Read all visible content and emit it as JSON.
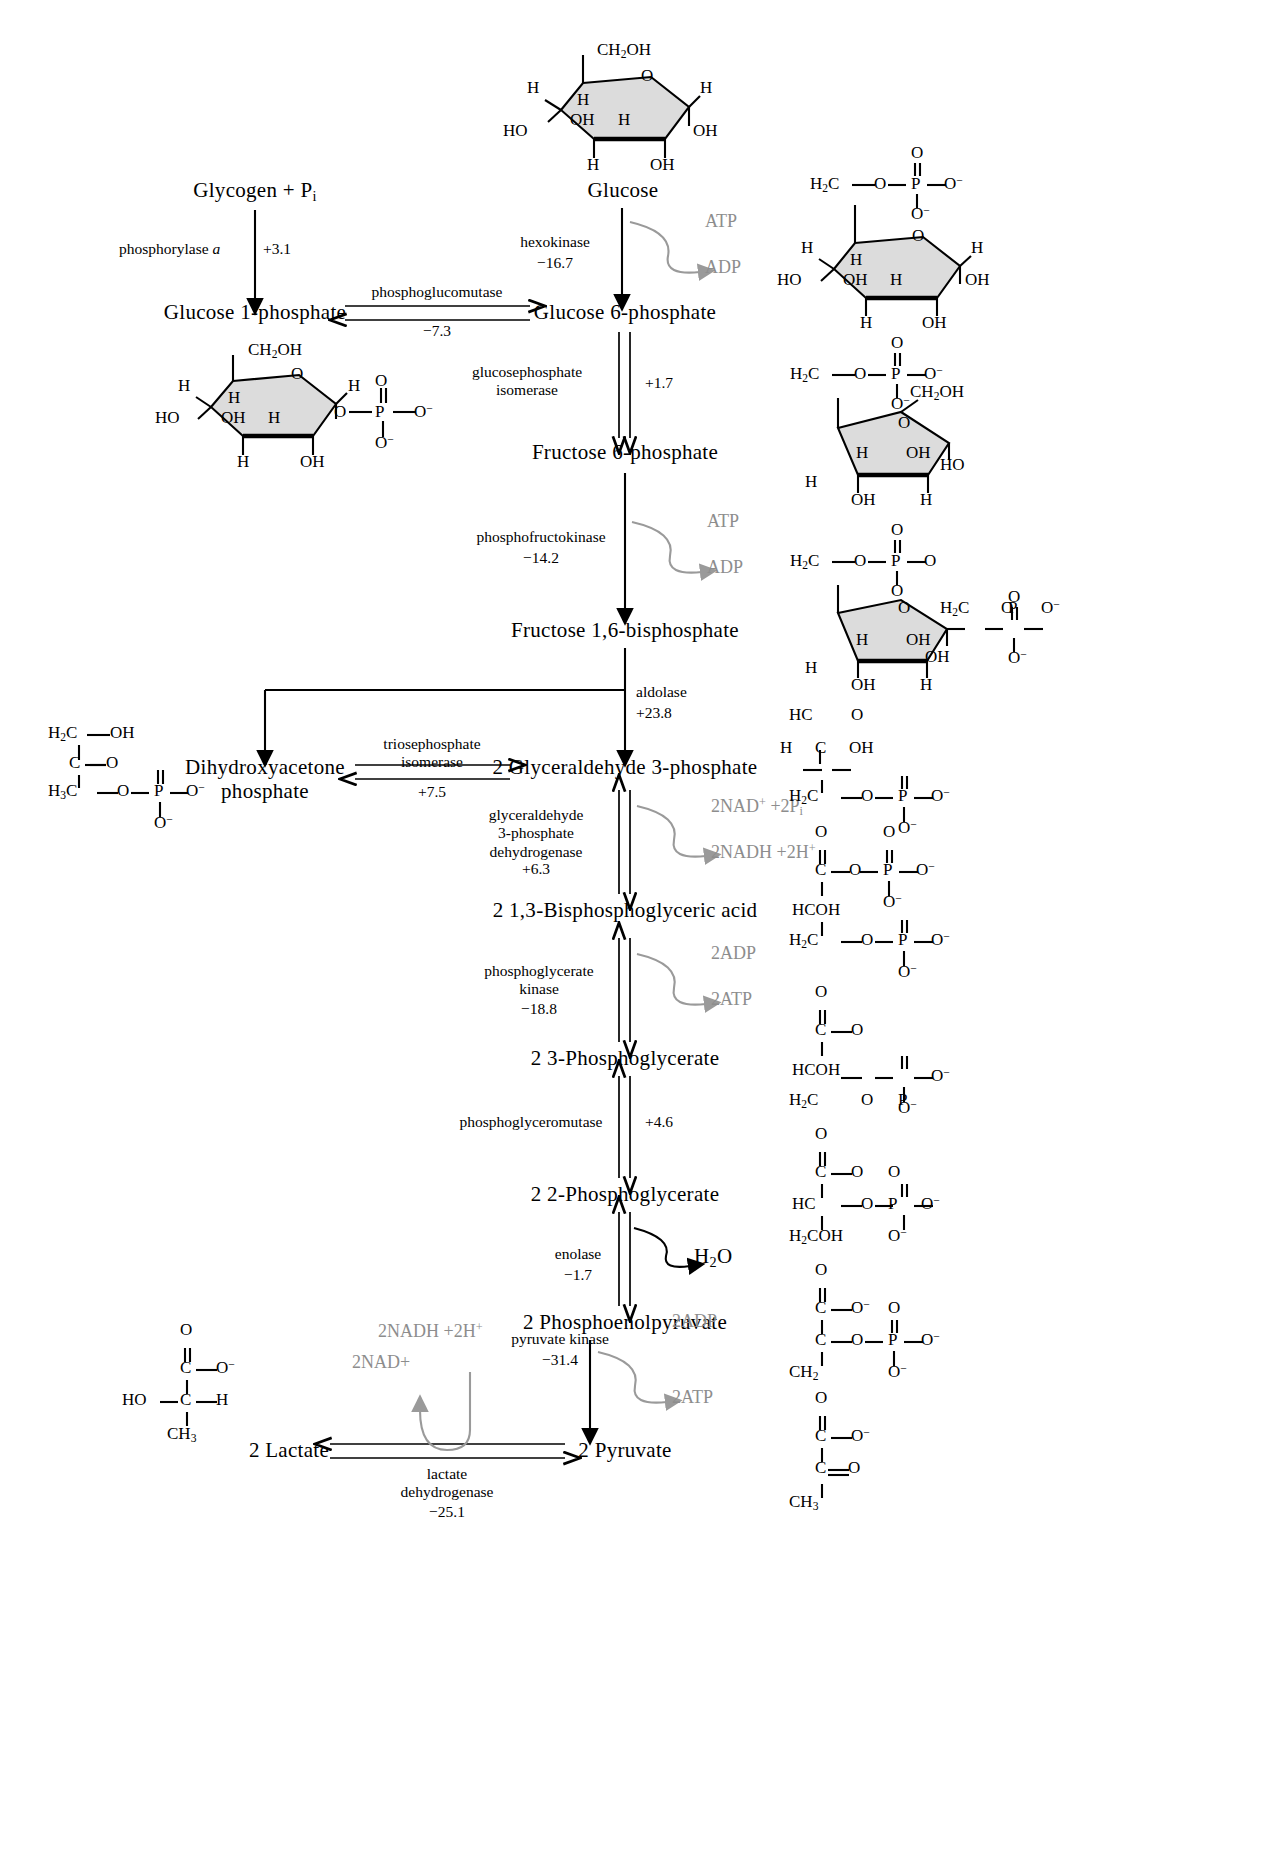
{
  "diagram": {
    "units_note": "ΔG values in kJ/mol"
  },
  "metabolites": {
    "glycogen": "Glycogen + P",
    "glycogen_sub": "i",
    "glucose": "Glucose",
    "glucose_1_phosphate": "Glucose 1-phosphate",
    "glucose_6_phosphate": "Glucose 6-phosphate",
    "fructose_6_phosphate": "Fructose 6-phosphate",
    "fructose_16_bisphosphate": "Fructose 1,6-bisphosphate",
    "dhap_line1": "Dihydroxyacetone",
    "dhap_line2": "phosphate",
    "g3p": "2 Glyceraldehyde 3-phosphate",
    "bpg": "2 1,3-Bisphosphoglyceric acid",
    "pg3": "2 3-Phosphoglycerate",
    "pg2": "2 2-Phosphoglycerate",
    "pep": "2 Phosphoenolpyruvate",
    "pyruvate": "2 Pyruvate",
    "lactate": "2 Lactate"
  },
  "enzymes": [
    {
      "id": "phosphorylase-a",
      "name": "phosphorylase a",
      "italic_tail": "a",
      "dg": "+3.1"
    },
    {
      "id": "phosphoglucomutase",
      "name": "phosphoglucomutase",
      "dg": "−7.3"
    },
    {
      "id": "hexokinase",
      "name": "hexokinase",
      "dg": "−16.7"
    },
    {
      "id": "glucosephosphate-isomerase",
      "name_line1": "glucosephosphate",
      "name_line2": "isomerase",
      "dg": "+1.7"
    },
    {
      "id": "phosphofructokinase",
      "name": "phosphofructokinase",
      "dg": "−14.2"
    },
    {
      "id": "aldolase",
      "name": "aldolase",
      "dg": "+23.8"
    },
    {
      "id": "triosephosphate-isomerase",
      "name_line1": "triosephosphate",
      "name_line2": "isomerase",
      "dg": "+7.5"
    },
    {
      "id": "gapdh",
      "name_line1": "glyceraldehyde",
      "name_line2": "3-phosphate",
      "name_line3": "dehydrogenase",
      "dg": "+6.3"
    },
    {
      "id": "phosphoglycerate-kinase",
      "name_line1": "phosphoglycerate",
      "name_line2": "kinase",
      "dg": "−18.8"
    },
    {
      "id": "phosphoglyceromutase",
      "name": "phosphoglyceromutase",
      "dg": "+4.6"
    },
    {
      "id": "enolase",
      "name": "enolase",
      "dg": "−1.7"
    },
    {
      "id": "pyruvate-kinase",
      "name": "pyruvate kinase",
      "dg": "−31.4"
    },
    {
      "id": "lactate-dehydrogenase",
      "name_line1": "lactate",
      "name_line2": "dehydrogenase",
      "dg": "−25.1"
    }
  ],
  "cofactors": {
    "atp": "ATP",
    "adp": "ADP",
    "nad_2": "2NAD",
    "nad_2_sup": "+",
    "pi_2": "+2P",
    "pi_2_sub": "i",
    "nadh_2": "2NADH +2H",
    "nadh_2_sup": "+",
    "adp_2": "2ADP",
    "atp_2": "2ATP",
    "water": "H",
    "water_sub": "2",
    "water_tail": "O",
    "nadh_2_ldh": "2NADH +2H",
    "nadh_2_ldh_sup": "+",
    "nad_2_ldh": "2NAD+"
  },
  "structures": {
    "glucose": {
      "label": "glucose-ring",
      "top": "CH2OH",
      "ring_o": "O",
      "left_h": "H",
      "right_h": "H",
      "inner_h": "H",
      "inner_oh": "OH",
      "inner_h2": "H",
      "ho": "HO",
      "right_oh": "OH",
      "bottom_h": "H",
      "bottom_oh": "OH"
    },
    "glucose_1_phosphate": {
      "label": "glucose-1-phosphate-ring",
      "top": "CH2OH",
      "phosphate": "O—P—O⁻",
      "phosphate_top_o": "O",
      "phosphate_bottom_o": "O⁻"
    },
    "glucose_6_phosphate": {
      "label": "glucose-6-phosphate-ring",
      "top": "H2C—O—P"
    },
    "fructose_6_phosphate": {
      "label": "fructose-6-phosphate-ring",
      "top": "H2C—O—P",
      "side": "CH2OH"
    },
    "fructose_16_bisphosphate": {
      "label": "fructose-1,6-bisphosphate-ring"
    },
    "dhap": {
      "label": "dihydroxyacetone-phosphate",
      "l1": "H2C—OH",
      "l2": "C=O",
      "l3": "H3C—O—P—O⁻"
    },
    "g3p": {
      "label": "glyceraldehyde-3-phosphate",
      "l1": "HC=O",
      "l2": "H—C—OH",
      "l3": "H2C—O—P—O⁻"
    },
    "bpg": {
      "label": "1,3-bisphosphoglycerate"
    },
    "pg3": {
      "label": "3-phosphoglycerate"
    },
    "pg2": {
      "label": "2-phosphoglycerate"
    },
    "pep": {
      "label": "phosphoenolpyruvate"
    },
    "pyruvate": {
      "label": "pyruvate"
    },
    "lactate": {
      "label": "lactate",
      "ho": "HO",
      "ch3": "CH3"
    }
  }
}
